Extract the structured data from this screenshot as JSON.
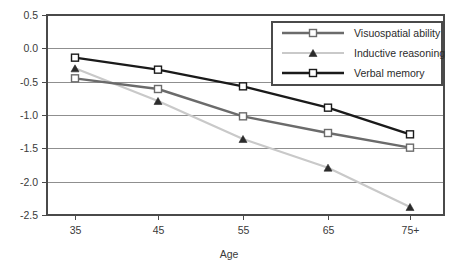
{
  "chart_data": {
    "type": "line",
    "title": "",
    "xlabel": "Age",
    "ylabel": "",
    "categories": [
      "35",
      "45",
      "55",
      "65",
      "75+"
    ],
    "x_tick_labels": [
      "35",
      "45",
      "55",
      "65",
      "75+"
    ],
    "y_tick_labels": [
      "0.5",
      "0.0",
      "-0.5",
      "-1.0",
      "-1.5",
      "-2.0",
      "-2.5"
    ],
    "y_ticks": [
      0.5,
      0.0,
      -0.5,
      -1.0,
      -1.5,
      -2.0,
      -2.5
    ],
    "ylim": [
      -2.5,
      0.5
    ],
    "grid": "horizontal",
    "legend_position": "top-right",
    "series": [
      {
        "name": "Visuospatial ability",
        "values": [
          -0.45,
          -0.61,
          -1.02,
          -1.27,
          -1.49
        ],
        "color": "#6b6b6b",
        "marker": "open-square"
      },
      {
        "name": "Inductive reasoning",
        "values": [
          -0.3,
          -0.79,
          -1.36,
          -1.79,
          -2.38
        ],
        "color": "#c9c9c9",
        "marker": "filled-triangle"
      },
      {
        "name": "Verbal memory",
        "values": [
          -0.14,
          -0.32,
          -0.57,
          -0.89,
          -1.29
        ],
        "color": "#1a1a1a",
        "marker": "open-square"
      }
    ]
  },
  "legend": {
    "items": [
      {
        "label": "Visuospatial ability"
      },
      {
        "label": "Inductive reasoning"
      },
      {
        "label": "Verbal memory"
      }
    ]
  },
  "axes": {
    "x_title": "Age"
  }
}
